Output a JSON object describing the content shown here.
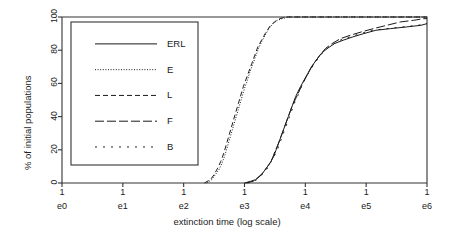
{
  "chart_data": {
    "type": "line",
    "title": "",
    "xlabel": "extinction time (log scale)",
    "ylabel": "% of initial populations",
    "x_tick_top": [
      "1",
      "1",
      "1",
      "1",
      "1",
      "1",
      "1"
    ],
    "x_tick_labels": [
      "e0",
      "e1",
      "e2",
      "e3",
      "e4",
      "e5",
      "e6"
    ],
    "x_tick_values": [
      0,
      1,
      2,
      3,
      4,
      5,
      6
    ],
    "y_tick_labels": [
      "0",
      "20",
      "40",
      "60",
      "80",
      "100"
    ],
    "y_tick_values": [
      0,
      20,
      40,
      60,
      80,
      100
    ],
    "xlim": [
      0,
      6
    ],
    "ylim": [
      0,
      100
    ],
    "grid": false,
    "legend_position": "upper-left-inside",
    "series": [
      {
        "name": "ERL",
        "style": "solid",
        "points": [
          [
            3.0,
            0
          ],
          [
            3.1,
            1
          ],
          [
            3.18,
            2
          ],
          [
            3.24,
            4
          ],
          [
            3.3,
            6
          ],
          [
            3.36,
            9
          ],
          [
            3.42,
            12
          ],
          [
            3.48,
            16
          ],
          [
            3.52,
            20
          ],
          [
            3.56,
            24
          ],
          [
            3.6,
            28
          ],
          [
            3.64,
            32
          ],
          [
            3.68,
            36
          ],
          [
            3.72,
            40
          ],
          [
            3.76,
            44
          ],
          [
            3.8,
            48
          ],
          [
            3.84,
            52
          ],
          [
            3.88,
            55
          ],
          [
            3.92,
            58
          ],
          [
            3.98,
            62
          ],
          [
            4.04,
            66
          ],
          [
            4.1,
            70
          ],
          [
            4.18,
            74
          ],
          [
            4.26,
            78
          ],
          [
            4.36,
            81
          ],
          [
            4.48,
            84
          ],
          [
            4.62,
            86
          ],
          [
            4.78,
            88
          ],
          [
            4.96,
            90
          ],
          [
            5.16,
            92
          ],
          [
            5.4,
            93
          ],
          [
            5.66,
            94
          ],
          [
            5.9,
            95
          ],
          [
            6.0,
            96
          ]
        ]
      },
      {
        "name": "E",
        "style": "dotted",
        "points": [
          [
            2.38,
            0
          ],
          [
            2.46,
            2
          ],
          [
            2.52,
            5
          ],
          [
            2.58,
            8
          ],
          [
            2.63,
            12
          ],
          [
            2.68,
            17
          ],
          [
            2.72,
            22
          ],
          [
            2.76,
            27
          ],
          [
            2.8,
            32
          ],
          [
            2.84,
            37
          ],
          [
            2.88,
            42
          ],
          [
            2.92,
            47
          ],
          [
            2.96,
            52
          ],
          [
            3.0,
            57
          ],
          [
            3.04,
            61
          ],
          [
            3.08,
            66
          ],
          [
            3.13,
            71
          ],
          [
            3.18,
            76
          ],
          [
            3.23,
            81
          ],
          [
            3.28,
            85
          ],
          [
            3.34,
            89
          ],
          [
            3.4,
            93
          ],
          [
            3.47,
            96
          ],
          [
            3.54,
            98
          ],
          [
            3.62,
            99
          ],
          [
            3.72,
            100
          ],
          [
            4.0,
            100
          ],
          [
            5.0,
            100
          ],
          [
            6.0,
            100
          ]
        ]
      },
      {
        "name": "L",
        "style": "dashed",
        "points": [
          [
            2.34,
            0
          ],
          [
            2.44,
            2
          ],
          [
            2.5,
            5
          ],
          [
            2.56,
            9
          ],
          [
            2.61,
            13
          ],
          [
            2.66,
            18
          ],
          [
            2.7,
            23
          ],
          [
            2.74,
            28
          ],
          [
            2.78,
            33
          ],
          [
            2.82,
            38
          ],
          [
            2.86,
            43
          ],
          [
            2.9,
            48
          ],
          [
            2.94,
            53
          ],
          [
            2.98,
            58
          ],
          [
            3.02,
            62
          ],
          [
            3.07,
            67
          ],
          [
            3.12,
            72
          ],
          [
            3.17,
            77
          ],
          [
            3.22,
            82
          ],
          [
            3.28,
            86
          ],
          [
            3.34,
            90
          ],
          [
            3.41,
            94
          ],
          [
            3.49,
            97
          ],
          [
            3.58,
            99
          ],
          [
            3.68,
            100
          ],
          [
            4.0,
            100
          ],
          [
            5.0,
            100
          ],
          [
            6.0,
            100
          ]
        ]
      },
      {
        "name": "F",
        "style": "longdash",
        "points": [
          [
            3.02,
            0
          ],
          [
            3.14,
            1
          ],
          [
            3.22,
            3
          ],
          [
            3.28,
            5
          ],
          [
            3.34,
            8
          ],
          [
            3.4,
            11
          ],
          [
            3.46,
            15
          ],
          [
            3.5,
            19
          ],
          [
            3.55,
            23
          ],
          [
            3.59,
            27
          ],
          [
            3.63,
            31
          ],
          [
            3.67,
            35
          ],
          [
            3.71,
            39
          ],
          [
            3.75,
            43
          ],
          [
            3.79,
            47
          ],
          [
            3.83,
            50
          ],
          [
            3.87,
            53
          ],
          [
            3.92,
            57
          ],
          [
            3.97,
            61
          ],
          [
            4.03,
            65
          ],
          [
            4.09,
            69
          ],
          [
            4.16,
            73
          ],
          [
            4.24,
            77
          ],
          [
            4.33,
            81
          ],
          [
            4.44,
            84
          ],
          [
            4.58,
            87
          ],
          [
            4.74,
            89
          ],
          [
            4.92,
            91
          ],
          [
            5.12,
            93
          ],
          [
            5.34,
            95
          ],
          [
            5.56,
            97
          ],
          [
            5.78,
            98
          ],
          [
            5.95,
            99
          ],
          [
            6.0,
            99
          ]
        ]
      },
      {
        "name": "B",
        "style": "sparsedot",
        "points": [
          [
            3.05,
            0
          ],
          [
            3.16,
            1
          ],
          [
            3.24,
            3
          ],
          [
            3.31,
            6
          ],
          [
            3.38,
            9
          ],
          [
            3.44,
            13
          ],
          [
            3.5,
            17
          ],
          [
            3.55,
            21
          ],
          [
            3.59,
            25
          ],
          [
            3.63,
            29
          ],
          [
            3.67,
            33
          ],
          [
            3.71,
            37
          ],
          [
            3.75,
            41
          ],
          [
            3.79,
            45
          ],
          [
            3.83,
            49
          ],
          [
            3.87,
            52
          ],
          [
            3.91,
            56
          ],
          [
            3.96,
            60
          ],
          [
            4.02,
            64
          ],
          [
            4.08,
            68
          ],
          [
            4.15,
            72
          ],
          [
            4.23,
            76
          ],
          [
            4.32,
            80
          ],
          [
            4.43,
            83
          ],
          [
            4.57,
            86
          ],
          [
            4.73,
            88
          ],
          [
            4.91,
            90
          ],
          [
            5.11,
            92
          ],
          [
            5.34,
            93
          ],
          [
            5.6,
            94
          ],
          [
            5.85,
            95
          ],
          [
            6.0,
            96
          ]
        ]
      }
    ]
  },
  "legend": {
    "entries": [
      {
        "label": "ERL",
        "style": "solid"
      },
      {
        "label": "E",
        "style": "dotted"
      },
      {
        "label": "L",
        "style": "dashed"
      },
      {
        "label": "F",
        "style": "longdash"
      },
      {
        "label": "B",
        "style": "sparsedot"
      }
    ]
  },
  "colors": {
    "line": "#1a1a1a",
    "axis": "#333333",
    "background": "#ffffff"
  }
}
